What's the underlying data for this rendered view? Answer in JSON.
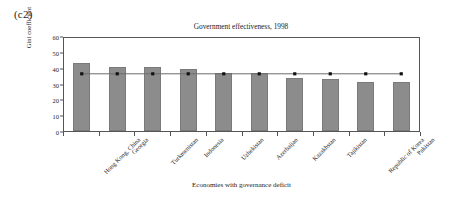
{
  "panel": {
    "label": "(c2)"
  },
  "chart_data": {
    "type": "bar",
    "title": "Government effectiveness, 1998",
    "xlabel": "Economies with governance deficit",
    "ylabel": "Gini coefficient",
    "ylim": [
      0,
      60
    ],
    "yticks": [
      0,
      10,
      20,
      30,
      40,
      50,
      60
    ],
    "ytick_labels": [
      "0",
      "10",
      "20",
      "30",
      "40",
      "50",
      "60"
    ],
    "grid": false,
    "legend": "none",
    "categories": [
      "Hong Kong, China",
      "Georgia",
      "Turkmenistan",
      "Indonesia",
      "Uzbekistan",
      "Azerbaijan",
      "Kazakhstan",
      "Tajikistan",
      "Republic of Korea",
      "Pakistan"
    ],
    "series": [
      {
        "name": "Gini coefficient",
        "type": "bar",
        "color": "#8c8c8c",
        "values": [
          43.1,
          40.5,
          40.4,
          39.1,
          36.8,
          36.6,
          33.6,
          33.0,
          31.2,
          30.8
        ]
      },
      {
        "name": "Average",
        "type": "line",
        "color": "#6b6b6b",
        "marker": "square",
        "marker_color": "#111111",
        "values": [
          36.9,
          36.9,
          36.9,
          36.9,
          36.9,
          36.9,
          36.9,
          36.9,
          36.9,
          36.9
        ]
      }
    ]
  },
  "style": {
    "frame_color": "#555555",
    "background": "#ffffff",
    "bar_color": "#8c8c8c",
    "line_color": "#6b6b6b",
    "marker_color": "#111111",
    "text_color": "#1a1a1a"
  }
}
